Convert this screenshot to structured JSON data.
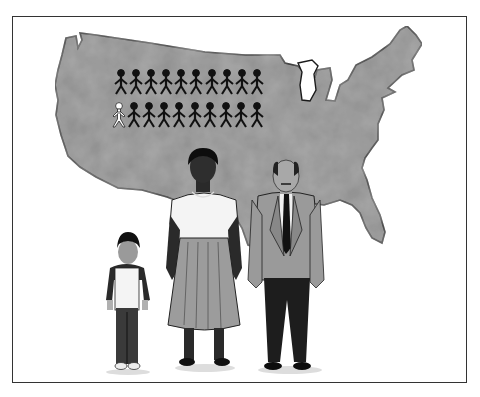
{
  "illustration": {
    "subject": "US map with population stick figures and three people",
    "colors": {
      "frame": "#333333",
      "map_fill": "#8c8c8c",
      "map_outline": "#1a1a1a",
      "figure_dark": "#111111",
      "figure_highlight": "#ffffff"
    },
    "stick_figures": {
      "rows": 2,
      "per_row": 10,
      "highlighted": [
        {
          "row": 2,
          "index": 1
        }
      ]
    },
    "people": [
      {
        "id": "child",
        "label": "boy"
      },
      {
        "id": "woman",
        "label": "woman"
      },
      {
        "id": "man",
        "label": "man"
      }
    ]
  }
}
